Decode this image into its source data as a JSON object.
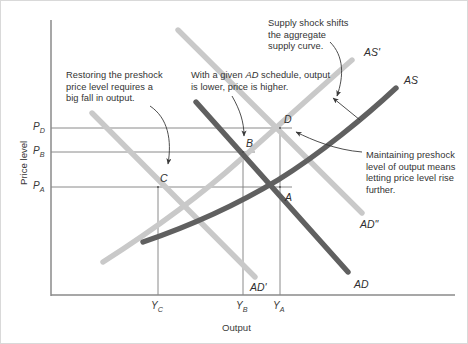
{
  "figure": {
    "type": "economics-diagram"
  },
  "axes": {
    "y_label": "Price level",
    "x_label": "Output",
    "y_ticks": [
      {
        "id": "PD",
        "base": "P",
        "sub": "D",
        "y_px": 128
      },
      {
        "id": "PB",
        "base": "P",
        "sub": "B",
        "y_px": 152
      },
      {
        "id": "PA",
        "base": "P",
        "sub": "A",
        "y_px": 187
      }
    ],
    "x_ticks": [
      {
        "id": "YC",
        "base": "Y",
        "sub": "C",
        "x_px": 158
      },
      {
        "id": "YB",
        "base": "Y",
        "sub": "B",
        "x_px": 243
      },
      {
        "id": "YA",
        "base": "Y",
        "sub": "A",
        "x_px": 280
      }
    ]
  },
  "colors": {
    "curve_dark": "#606060",
    "curve_light": "#c9c9c9",
    "axis": "#8a8a8a",
    "guide": "#7d7d7d",
    "text": "#333333",
    "background": "#ffffff"
  },
  "curves": [
    {
      "name": "AS",
      "label": "AS",
      "tone": "dark",
      "label_x": 404,
      "label_y": 74
    },
    {
      "name": "AS'",
      "label": "AS'",
      "tone": "light",
      "label_x": 364,
      "label_y": 46
    },
    {
      "name": "AD",
      "label": "AD",
      "tone": "dark",
      "label_x": 354,
      "label_y": 278
    },
    {
      "name": "AD'",
      "label": "AD'",
      "tone": "light",
      "label_x": 250,
      "label_y": 281
    },
    {
      "name": "AD\"",
      "label": "AD\"",
      "tone": "light",
      "label_x": 360,
      "label_y": 218
    }
  ],
  "points": [
    {
      "label": "A",
      "x_px": 280,
      "y_px": 187,
      "label_x": 285,
      "label_y": 191
    },
    {
      "label": "B",
      "x_px": 243,
      "y_px": 152,
      "label_x": 246,
      "label_y": 137
    },
    {
      "label": "C",
      "x_px": 158,
      "y_px": 187,
      "label_x": 160,
      "label_y": 172
    },
    {
      "label": "D",
      "x_px": 280,
      "y_px": 128,
      "label_x": 284,
      "label_y": 113
    }
  ],
  "annotations": [
    {
      "id": "restoring-preshock",
      "text": "Restoring the preshock\nprice level requires a\nbig fall in output.",
      "x": 66,
      "y": 70,
      "width": 125
    },
    {
      "id": "given-ad-schedule",
      "text_parts": [
        "With a given ",
        "AD",
        " schedule, output\nis lower, price is higher."
      ],
      "x": 191,
      "y": 70,
      "width": 135
    },
    {
      "id": "supply-shock-shifts",
      "text": "Supply shock shifts\nthe aggregate\nsupply curve.",
      "x": 268,
      "y": 18,
      "width": 110
    },
    {
      "id": "maintaining-preshock",
      "text": "Maintaining preshock\nlevel of output means\nletting price level rise\nfurther.",
      "x": 366,
      "y": 150,
      "width": 102
    }
  ]
}
